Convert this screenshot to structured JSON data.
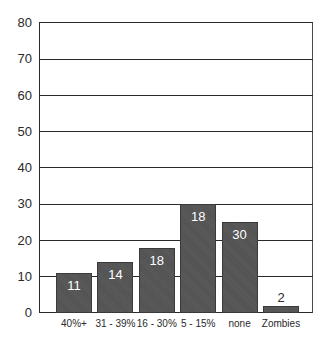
{
  "chart_data": {
    "type": "bar",
    "title": "",
    "xlabel": "",
    "ylabel": "",
    "categories": [
      "40%+",
      "31 - 39%",
      "16 - 30%",
      "5 - 15%",
      "none",
      "Zombies"
    ],
    "values": [
      11,
      14,
      18,
      30,
      25,
      2
    ],
    "data_labels": [
      "11",
      "14",
      "18",
      "18",
      "30",
      "2"
    ],
    "ylim": [
      0,
      80
    ],
    "yticks": [
      "0",
      "10",
      "20",
      "30",
      "40",
      "50",
      "60",
      "70",
      "80"
    ],
    "grid": true,
    "legend": null,
    "bar_color": "#555555"
  }
}
